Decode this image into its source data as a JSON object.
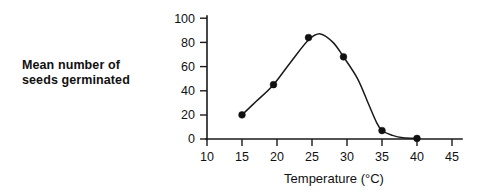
{
  "chart_data": {
    "type": "scatter",
    "title": "",
    "xlabel": "Temperature (°C)",
    "ylabel": "Mean number of seeds germinated",
    "ylabel_lines": [
      "Mean number of",
      "seeds germinated"
    ],
    "xlim": [
      10,
      45
    ],
    "ylim": [
      0,
      100
    ],
    "xticks": [
      10,
      15,
      20,
      25,
      30,
      35,
      40,
      45
    ],
    "xtick_labels": [
      "10",
      "15",
      "20",
      "25",
      "30",
      "35",
      "40",
      "45"
    ],
    "yticks": [
      0,
      20,
      40,
      60,
      80,
      100
    ],
    "ytick_labels": [
      "0",
      "20",
      "40",
      "60",
      "80",
      "100"
    ],
    "grid": false,
    "legend": null,
    "marker_style": "filled-circle",
    "line_style": "smooth-fitted-curve",
    "series": [
      {
        "name": "Mean number of seeds germinated",
        "color": "#111111",
        "x": [
          15,
          19.5,
          24.5,
          29.5,
          35,
          40
        ],
        "values": [
          20,
          45,
          84,
          68,
          7,
          0.5
        ]
      }
    ],
    "curve_points": [
      [
        15,
        20
      ],
      [
        17,
        31
      ],
      [
        19.5,
        45
      ],
      [
        22,
        64
      ],
      [
        24.5,
        82
      ],
      [
        26.2,
        87
      ],
      [
        28,
        80
      ],
      [
        29.5,
        68
      ],
      [
        31.5,
        50
      ],
      [
        33,
        30
      ],
      [
        34.2,
        14
      ],
      [
        35,
        7
      ],
      [
        36.5,
        3
      ],
      [
        38,
        1
      ],
      [
        40,
        0.5
      ]
    ]
  },
  "axis": {
    "x_title": "Temperature (°C)",
    "y_title_line1": "Mean number of",
    "y_title_line2": "seeds germinated"
  },
  "colors": {
    "ink": "#111111",
    "background": "#ffffff"
  }
}
